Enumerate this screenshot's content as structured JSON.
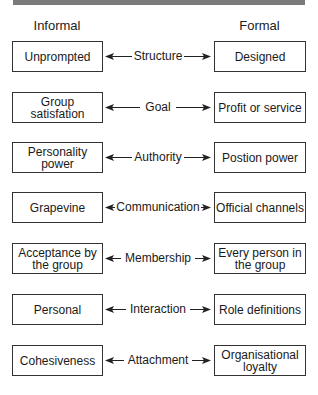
{
  "diagram": {
    "headers": {
      "left": "Informal",
      "right": "Formal"
    },
    "rows": [
      {
        "informal": "Unprompted",
        "dimension": "Structure",
        "formal": "Designed"
      },
      {
        "informal": "Group satisfation",
        "dimension": "Goal",
        "formal": "Profit or service"
      },
      {
        "informal": "Personality power",
        "dimension": "Authority",
        "formal": "Postion power"
      },
      {
        "informal": "Grapevine",
        "dimension": "Communication",
        "formal": "Official channels"
      },
      {
        "informal": "Acceptance by the group",
        "dimension": "Membership",
        "formal": "Every person in the group"
      },
      {
        "informal": "Personal",
        "dimension": "Interaction",
        "formal": "Role definitions"
      },
      {
        "informal": "Cohesiveness",
        "dimension": "Attachment",
        "formal": "Organisational loyalty"
      }
    ],
    "arrow_icon": "double-headed-arrow",
    "colors": {
      "border": "#333333",
      "topbar": "#7a7a7a",
      "text": "#1a1a1a"
    }
  }
}
